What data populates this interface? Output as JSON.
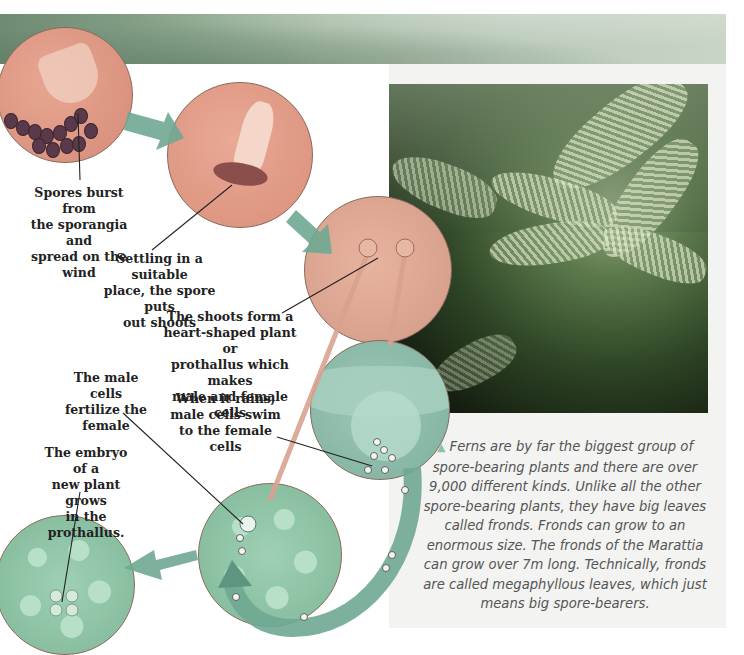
{
  "diagram": {
    "stages": [
      {
        "id": "spores",
        "label": "Spores burst from the sporangia and spread on the wind"
      },
      {
        "id": "settling",
        "label": "Settling in a suitable place, the spore puts out shoots"
      },
      {
        "id": "prothallus",
        "label": "The shoots form a heart-shaped plant or prothallus which makes male and female cells"
      },
      {
        "id": "rain",
        "label": "When it rains, male cells swim to the female cells"
      },
      {
        "id": "fertilize",
        "label": "The male cells fertilize the female"
      },
      {
        "id": "embryo",
        "label": "The embryo of a new plant grows in the prothallus."
      }
    ],
    "label_lines": {
      "spores": [
        "Spores burst from",
        "the sporangia and",
        "spread on the wind"
      ],
      "settling": [
        "Settling in a suitable",
        "place, the spore puts",
        "out shoots"
      ],
      "prothallus": [
        "The shoots form a",
        "heart-shaped plant or",
        "prothallus which makes",
        "male and female cells"
      ],
      "fertilize": [
        "The male cells",
        "fertilize the",
        "female"
      ],
      "rain": [
        "When it rains,",
        "male cells swim",
        "to the female cells"
      ],
      "embryo": [
        "The embryo of a",
        "new plant grows",
        "in the prothallus."
      ]
    }
  },
  "photo": {
    "subject": "ferns in a forest"
  },
  "caption": {
    "marker": "▲",
    "text": "Ferns are by far the biggest group of spore-bearing plants and there are over 9,000 different kinds. Unlike all the other spore-bearing plants, they have big leaves called fronds. Fronds can grow to an enormous size. The fronds of the Marattia can grow over 7m long. Technically, fronds are called megaphyllous leaves, which just means big spore-bearers."
  },
  "colors": {
    "arrow": "#6fa892",
    "arrow_dark": "#5d9580",
    "circle_pink": "#dd9583",
    "circle_green": "#8fc4a7",
    "stalk": "#d9a28f",
    "leader_line": "#222222",
    "caption_text": "#555555",
    "caption_marker": "#8fc1a6"
  }
}
